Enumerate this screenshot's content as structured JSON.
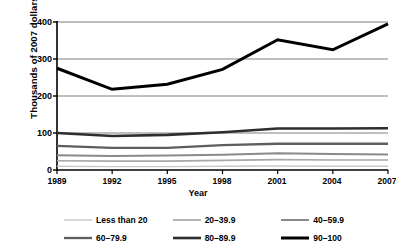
{
  "chart_data": {
    "type": "line",
    "title": "",
    "xlabel": "Year",
    "ylabel": "Thousands of 2007 dollars",
    "categories": [
      "1989",
      "1992",
      "1995",
      "1998",
      "2001",
      "2004",
      "2007"
    ],
    "x": [
      1989,
      1992,
      1995,
      1998,
      2001,
      2004,
      2007
    ],
    "xlim": [
      1989,
      2007
    ],
    "ylim": [
      0,
      400
    ],
    "yticks": [
      0,
      100,
      200,
      300,
      400
    ],
    "ytick_labels": [
      "0",
      "100",
      "200",
      "300",
      "400"
    ],
    "grid": "horizontal",
    "legend_position": "bottom",
    "series": [
      {
        "name": "Less than 20",
        "values": [
          10,
          9,
          9,
          10,
          11,
          10,
          10
        ],
        "color": "#c9c9c9",
        "width": 1.4
      },
      {
        "name": "20–39.9",
        "values": [
          25,
          24,
          24,
          26,
          28,
          27,
          27
        ],
        "color": "#a8a8a8",
        "width": 1.7
      },
      {
        "name": "40–59.9",
        "values": [
          40,
          38,
          39,
          41,
          45,
          43,
          42
        ],
        "color": "#8a8a8a",
        "width": 2.0
      },
      {
        "name": "60–79.9",
        "values": [
          65,
          60,
          60,
          67,
          71,
          71,
          71
        ],
        "color": "#5e5e5e",
        "width": 2.3
      },
      {
        "name": "80–89.9",
        "values": [
          100,
          92,
          95,
          102,
          112,
          112,
          113
        ],
        "color": "#2e2e2e",
        "width": 2.6
      },
      {
        "name": "90–100",
        "values": [
          275,
          218,
          232,
          272,
          352,
          325,
          395
        ],
        "color": "#000000",
        "width": 3.0
      }
    ]
  },
  "axes": {
    "ylabel": "Thousands of 2007 dollars",
    "xlabel": "Year",
    "ytick_labels": [
      "400",
      "300",
      "200",
      "100",
      "0"
    ],
    "xtick_labels": [
      "1989",
      "1992",
      "1995",
      "1998",
      "2001",
      "2004",
      "2007"
    ]
  },
  "legend": {
    "items": [
      {
        "label": "Less than 20"
      },
      {
        "label": "20–39.9"
      },
      {
        "label": "40–59.9"
      },
      {
        "label": "60–79.9"
      },
      {
        "label": "80–89.9"
      },
      {
        "label": "90–100"
      }
    ]
  },
  "colors": {
    "gridline": "#808080",
    "axis": "#000000",
    "background": "#ffffff"
  }
}
